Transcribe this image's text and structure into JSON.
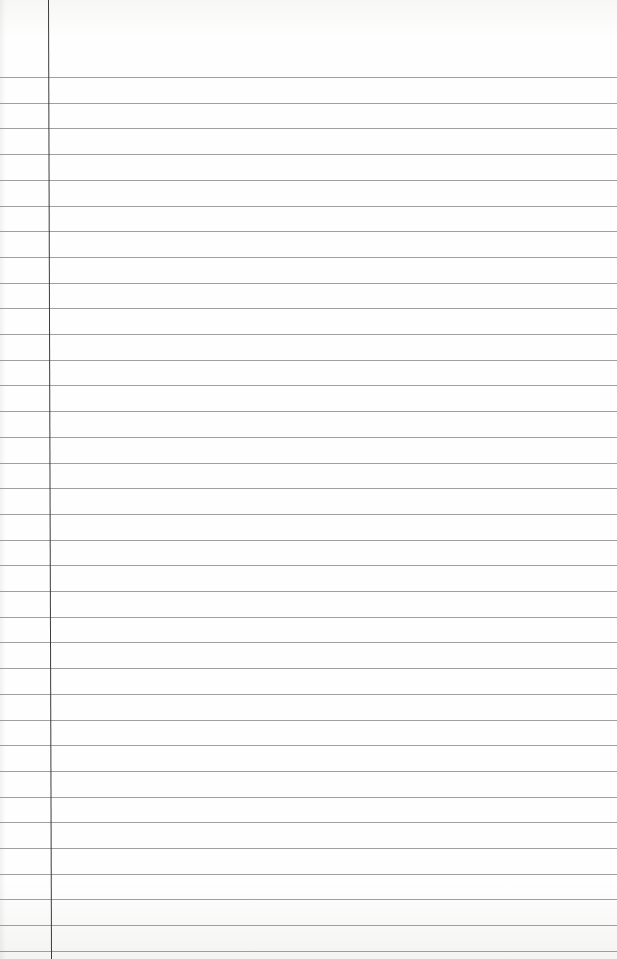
{
  "paper": {
    "type": "lined-notebook-page",
    "background_color": "#fefefe",
    "rule_color": "#8e8e8e",
    "margin_color": "#3c3c3c",
    "first_rule_y": 77,
    "rule_spacing": 25.7,
    "rule_count": 35,
    "margin_x": 48,
    "text": ""
  }
}
